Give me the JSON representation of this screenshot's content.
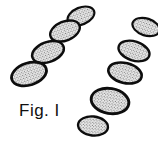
{
  "figure": {
    "caption": "Fig. I",
    "background_color": "#ffffff",
    "outline_color": "#0d0d0d",
    "fill_color": "#f2f2f2",
    "texture": "stipple-dot-mesh",
    "texture_color": "#2a2a2a",
    "element_count": 9,
    "discs": [
      {
        "name": "disc-left-1",
        "cx": 81,
        "cy": 16,
        "rx": 14,
        "ry": 8.5,
        "rotate": -22,
        "stroke": 2.2
      },
      {
        "name": "disc-left-2",
        "cx": 65,
        "cy": 31,
        "rx": 15.5,
        "ry": 9.5,
        "rotate": -22,
        "stroke": 2.4
      },
      {
        "name": "disc-left-3",
        "cx": 48,
        "cy": 52,
        "rx": 16.5,
        "ry": 10,
        "rotate": -20,
        "stroke": 2.5
      },
      {
        "name": "disc-left-4",
        "cx": 29,
        "cy": 74,
        "rx": 18,
        "ry": 11,
        "rotate": -18,
        "stroke": 2.8
      },
      {
        "name": "disc-right-1",
        "cx": 146,
        "cy": 27,
        "rx": 14,
        "ry": 8.5,
        "rotate": 18,
        "stroke": 2.2
      },
      {
        "name": "disc-right-2",
        "cx": 134,
        "cy": 51,
        "rx": 16,
        "ry": 9.5,
        "rotate": 18,
        "stroke": 2.4
      },
      {
        "name": "disc-right-3",
        "cx": 125,
        "cy": 73,
        "rx": 17,
        "ry": 10,
        "rotate": 14,
        "stroke": 2.6
      },
      {
        "name": "disc-right-4",
        "cx": 110,
        "cy": 101,
        "rx": 19,
        "ry": 12.5,
        "rotate": 10,
        "stroke": 2.9
      },
      {
        "name": "disc-bottom",
        "cx": 93,
        "cy": 126,
        "rx": 15,
        "ry": 9.5,
        "rotate": 6,
        "stroke": 2.4
      }
    ]
  }
}
